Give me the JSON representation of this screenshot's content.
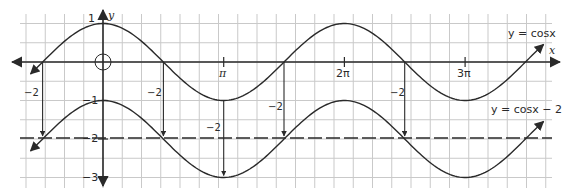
{
  "chart_data": {
    "type": "line",
    "title": "",
    "xlabel": "x",
    "ylabel": "y",
    "x_range": [
      -2.05,
      4.0
    ],
    "x_range_unit": "pi",
    "ylim": [
      -3.2,
      1.2
    ],
    "grid": true,
    "x_ticks": [
      {
        "value_pi": 1,
        "label": "π"
      },
      {
        "value_pi": 2,
        "label": "2π"
      },
      {
        "value_pi": 3,
        "label": "3π"
      }
    ],
    "y_ticks": [
      {
        "value": 1,
        "label": "1"
      },
      {
        "value": -1,
        "label": "−1"
      },
      {
        "value": -2,
        "label": "−2"
      },
      {
        "value": -3,
        "label": "−3"
      }
    ],
    "series": [
      {
        "name": "y = cosx",
        "function": "cos(x)",
        "label": "y = cosx"
      },
      {
        "name": "y = cosx − 2",
        "function": "cos(x) - 2",
        "label": "y = cosx − 2"
      }
    ],
    "reference_lines": [
      {
        "type": "horizontal",
        "y": -2,
        "style": "dashed"
      }
    ],
    "annotations": [
      {
        "type": "shift-arrow",
        "x_pi": -0.5,
        "label": "−2"
      },
      {
        "type": "shift-arrow",
        "x_pi": 0.5,
        "label": "−2"
      },
      {
        "type": "shift-arrow",
        "x_pi": 1.0,
        "label": "−2"
      },
      {
        "type": "shift-arrow",
        "x_pi": 1.5,
        "label": "−2"
      },
      {
        "type": "shift-arrow",
        "x_pi": 2.5,
        "label": "−2"
      },
      {
        "type": "origin-circle",
        "x": 0,
        "y": 0
      }
    ]
  },
  "labels": {
    "x_axis": "x",
    "y_axis": "y",
    "y_one": "1",
    "y_neg_one": "−1",
    "y_neg_two": "−2",
    "y_neg_three": "−3",
    "pi": "π",
    "two_pi": "2π",
    "three_pi": "3π",
    "curve1": "y = cosx",
    "curve2": "y = cosx − 2",
    "shift": "−2"
  }
}
